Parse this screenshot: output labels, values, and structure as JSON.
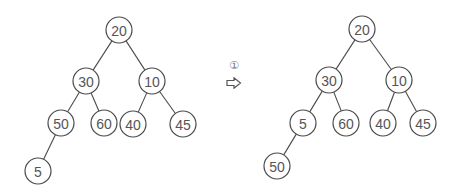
{
  "diagram": {
    "type": "binary-tree-transformation",
    "step_marker": "①",
    "arrow_icon": "hollow-right-arrow",
    "before_tree": {
      "nodes": [
        {
          "id": "b20",
          "value": "20",
          "x": 119,
          "y": 30
        },
        {
          "id": "b30",
          "value": "30",
          "x": 86,
          "y": 81
        },
        {
          "id": "b10",
          "value": "10",
          "x": 152,
          "y": 81
        },
        {
          "id": "b50",
          "value": "50",
          "x": 61,
          "y": 123
        },
        {
          "id": "b60",
          "value": "60",
          "x": 104,
          "y": 123
        },
        {
          "id": "b40",
          "value": "40",
          "x": 133,
          "y": 124
        },
        {
          "id": "b45",
          "value": "45",
          "x": 183,
          "y": 124
        },
        {
          "id": "b5",
          "value": "5",
          "x": 38,
          "y": 171
        }
      ],
      "edges": [
        [
          "b20",
          "b30"
        ],
        [
          "b20",
          "b10"
        ],
        [
          "b30",
          "b50"
        ],
        [
          "b30",
          "b60"
        ],
        [
          "b10",
          "b40"
        ],
        [
          "b10",
          "b45"
        ],
        [
          "b50",
          "b5"
        ]
      ]
    },
    "after_tree": {
      "nodes": [
        {
          "id": "a20",
          "value": "20",
          "x": 362,
          "y": 29
        },
        {
          "id": "a30",
          "value": "30",
          "x": 329,
          "y": 80
        },
        {
          "id": "a10",
          "value": "10",
          "x": 399,
          "y": 80
        },
        {
          "id": "a5",
          "value": "5",
          "x": 303,
          "y": 123
        },
        {
          "id": "a60",
          "value": "60",
          "x": 346,
          "y": 123
        },
        {
          "id": "a40",
          "value": "40",
          "x": 383,
          "y": 123
        },
        {
          "id": "a45",
          "value": "45",
          "x": 423,
          "y": 123
        },
        {
          "id": "a50",
          "value": "50",
          "x": 277,
          "y": 166
        }
      ],
      "edges": [
        [
          "a20",
          "a30"
        ],
        [
          "a20",
          "a10"
        ],
        [
          "a30",
          "a5"
        ],
        [
          "a30",
          "a60"
        ],
        [
          "a10",
          "a40"
        ],
        [
          "a10",
          "a45"
        ],
        [
          "a5",
          "a50"
        ]
      ]
    },
    "node_radius": 13,
    "colors": {
      "stroke": "#4a4a4a",
      "text": "#555555",
      "background": "#ffffff"
    }
  }
}
